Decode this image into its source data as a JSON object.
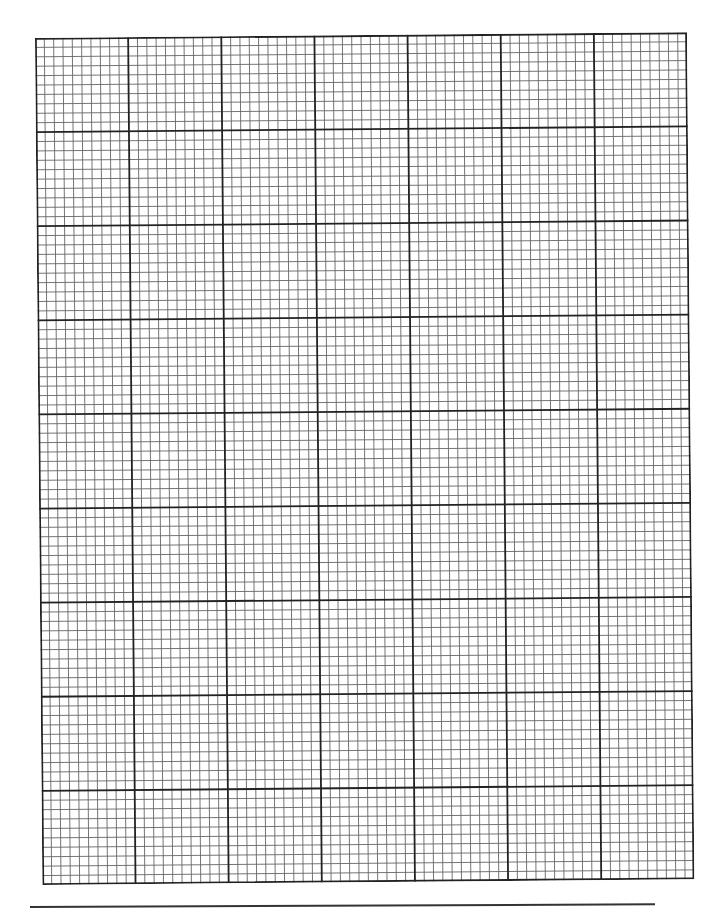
{
  "page": {
    "type": "graph-paper",
    "background_color": "#ffffff"
  },
  "grid": {
    "major_columns": 7,
    "major_rows": 9,
    "minor_per_major": 10,
    "total_minor_columns": 70,
    "total_minor_rows": 90,
    "minor_line_color": "#666666",
    "major_line_color": "#222222",
    "border_color": "#222222"
  },
  "footer_line": {
    "color": "#333333"
  }
}
